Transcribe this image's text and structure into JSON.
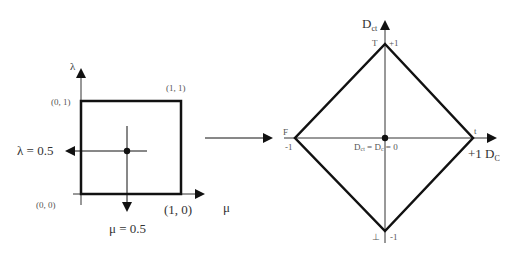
{
  "left_panel": {
    "axis_y_label": "λ",
    "axis_x_label": "μ",
    "corner_labels": {
      "bottom_left": "(0, 0)",
      "top_left": "(0, 1)",
      "top_right": "(1, 1)",
      "bottom_right": "(1, 0)"
    },
    "lambda_label": "λ = 0.5",
    "mu_label": "μ = 0.5"
  },
  "right_panel": {
    "axis_y_label_main": "D",
    "axis_y_label_sub": "ct",
    "axis_x_label_main": "D",
    "axis_x_label_sub": "C",
    "vertex_labels": {
      "top_symbol": "T",
      "top_value": "+1",
      "bottom_symbol": "⊥",
      "bottom_value": "-1",
      "left_symbol": "F",
      "left_value": "-1",
      "right_symbol": "t",
      "right_value": "+1"
    },
    "center_label": {
      "d1": "D",
      "d1_sub": "ct",
      "eq1": " = ",
      "d2": "D",
      "d2_sub": "c",
      "eq2": " = 0"
    }
  },
  "colors": {
    "stroke": "#111111",
    "text": "#333333"
  }
}
